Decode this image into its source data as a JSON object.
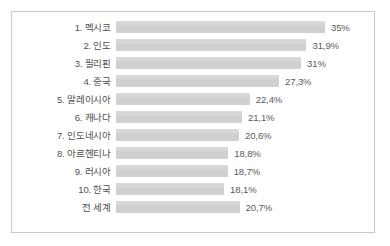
{
  "chart_data": {
    "type": "bar",
    "orientation": "horizontal",
    "title": "",
    "subtitle": "",
    "xlabel": "",
    "ylabel": "",
    "grid": false,
    "legend": null,
    "value_suffix": "%",
    "decimal_separator": ",",
    "xlim": [
      0,
      35
    ],
    "axis_max_for_scale": 35,
    "colors": {
      "bar_fill": "#d2d2d2",
      "bar_fill_top": "#dadada",
      "frame_border": "#c9c9c9",
      "label_text": "#4f4f4f",
      "value_text": "#5a5a5a",
      "background": "#ffffff"
    },
    "categories": [
      "1. 멕시코",
      "2. 인도",
      "3. 필리핀",
      "4. 중국",
      "5. 말레이시아",
      "6. 캐나다",
      "7. 인도네시아",
      "8. 아르헨티나",
      "9. 러시아",
      "10. 한국",
      "전 세계"
    ],
    "values": [
      35,
      31.9,
      31,
      27.3,
      22.4,
      21.1,
      20.6,
      18.8,
      18.7,
      18.1,
      20.7
    ],
    "value_labels": [
      "35%",
      "31,9%",
      "31%",
      "27,3%",
      "22,4%",
      "21,1%",
      "20,6%",
      "18,8%",
      "18,7%",
      "18,1%",
      "20,7%"
    ],
    "rows": [
      {
        "label": "1. 멕시코",
        "value": 35,
        "value_label": "35%"
      },
      {
        "label": "2. 인도",
        "value": 31.9,
        "value_label": "31,9%"
      },
      {
        "label": "3. 필리핀",
        "value": 31,
        "value_label": "31%"
      },
      {
        "label": "4. 중국",
        "value": 27.3,
        "value_label": "27,3%"
      },
      {
        "label": "5. 말레이시아",
        "value": 22.4,
        "value_label": "22,4%"
      },
      {
        "label": "6. 캐나다",
        "value": 21.1,
        "value_label": "21,1%"
      },
      {
        "label": "7. 인도네시아",
        "value": 20.6,
        "value_label": "20,6%"
      },
      {
        "label": "8. 아르헨티나",
        "value": 18.8,
        "value_label": "18,8%"
      },
      {
        "label": "9. 러시아",
        "value": 18.7,
        "value_label": "18,7%"
      },
      {
        "label": "10. 한국",
        "value": 18.1,
        "value_label": "18,1%"
      },
      {
        "label": "전 세계",
        "value": 20.7,
        "value_label": "20,7%"
      }
    ]
  }
}
